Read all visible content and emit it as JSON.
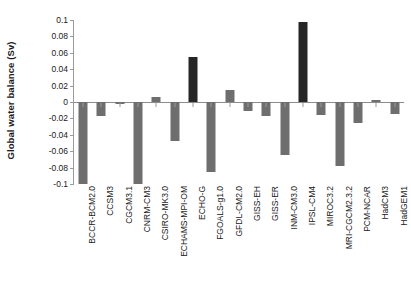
{
  "chart_data": {
    "type": "bar",
    "title": "",
    "xlabel": "",
    "ylabel": "Global water balance (Sv)",
    "ylim": [
      -0.1,
      0.1
    ],
    "yticks": [
      0.1,
      0.08,
      0.06,
      0.04,
      0.02,
      0,
      -0.02,
      -0.04,
      -0.06,
      -0.08,
      -0.1
    ],
    "ytick_labels": [
      "0.1",
      "0.08",
      "0.06",
      "0.04",
      "0.02",
      "0",
      "-0.02",
      "-0.04",
      "-0.06",
      "-0.08",
      "-0.1"
    ],
    "grid": false,
    "legend": null,
    "categories": [
      "BCCR-BCM2.0",
      "CCSM3",
      "CGCM3.1",
      "CNRM-CM3",
      "CSIRO-MK3.0",
      "ECHAMS-MPI-OM",
      "ECHO-G",
      "FGOALS-g1.0",
      "GFDL-CM2.0",
      "GISS-EH",
      "GISS-ER",
      "INM-CM3.0",
      "IPSL-CM4",
      "MIROC3.2",
      "MRI-CGCM2.3.2",
      "PCM-NCAR",
      "HadCM3",
      "HadGEM1"
    ],
    "values": [
      -0.1,
      -0.017,
      -0.003,
      -0.1,
      0.006,
      -0.047,
      0.055,
      -0.085,
      0.015,
      -0.011,
      -0.017,
      -0.065,
      0.097,
      -0.016,
      -0.078,
      -0.026,
      0.002,
      -0.015
    ],
    "bar_colors": [
      "#6e6e6e",
      "#6e6e6e",
      "#6e6e6e",
      "#6e6e6e",
      "#6e6e6e",
      "#6e6e6e",
      "#262626",
      "#6e6e6e",
      "#6e6e6e",
      "#6e6e6e",
      "#6e6e6e",
      "#6e6e6e",
      "#262626",
      "#6e6e6e",
      "#6e6e6e",
      "#6e6e6e",
      "#6e6e6e",
      "#6e6e6e"
    ],
    "colors": {
      "bar_gray": "#6e6e6e",
      "bar_dark": "#262626",
      "axis": "#9a9a9a",
      "text": "#1a1a1a",
      "background": "#ffffff"
    }
  }
}
